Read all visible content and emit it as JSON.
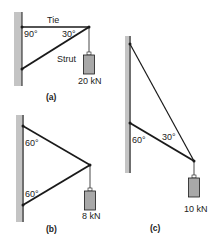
{
  "figures": [
    {
      "id": "a",
      "caption": "(a)",
      "members": [
        "Tie",
        "Strut"
      ],
      "angles": [
        "90°",
        "30°"
      ],
      "load": "20 kN"
    },
    {
      "id": "b",
      "caption": "(b)",
      "angles": [
        "60°",
        "60°"
      ],
      "load": "8 kN"
    },
    {
      "id": "c",
      "caption": "(c)",
      "angles": [
        "60°",
        "30°"
      ],
      "load": "10 kN"
    }
  ],
  "colors": {
    "wall": "#c4c4c4",
    "member": "#1a1a1a",
    "weight": "#a8a8a8"
  }
}
